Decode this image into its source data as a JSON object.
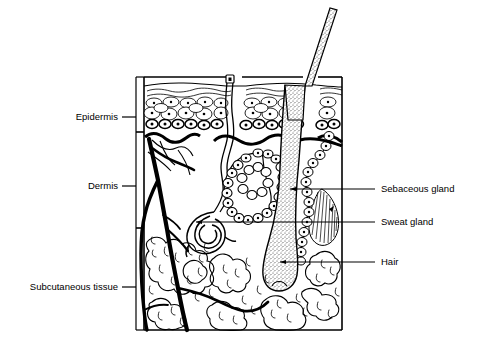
{
  "figure": {
    "background_color": "#ffffff",
    "ink_color": "#000000"
  },
  "layer_labels": [
    {
      "id": "epidermis",
      "label": "Epidermis"
    },
    {
      "id": "dermis",
      "label": "Dermis"
    },
    {
      "id": "subcutaneous",
      "label": "Subcutaneous tissue"
    }
  ],
  "structure_labels": [
    {
      "id": "sebaceous-gland",
      "label": "Sebaceous gland"
    },
    {
      "id": "sweat-gland",
      "label": "Sweat gland"
    },
    {
      "id": "hair",
      "label": "Hair"
    }
  ]
}
